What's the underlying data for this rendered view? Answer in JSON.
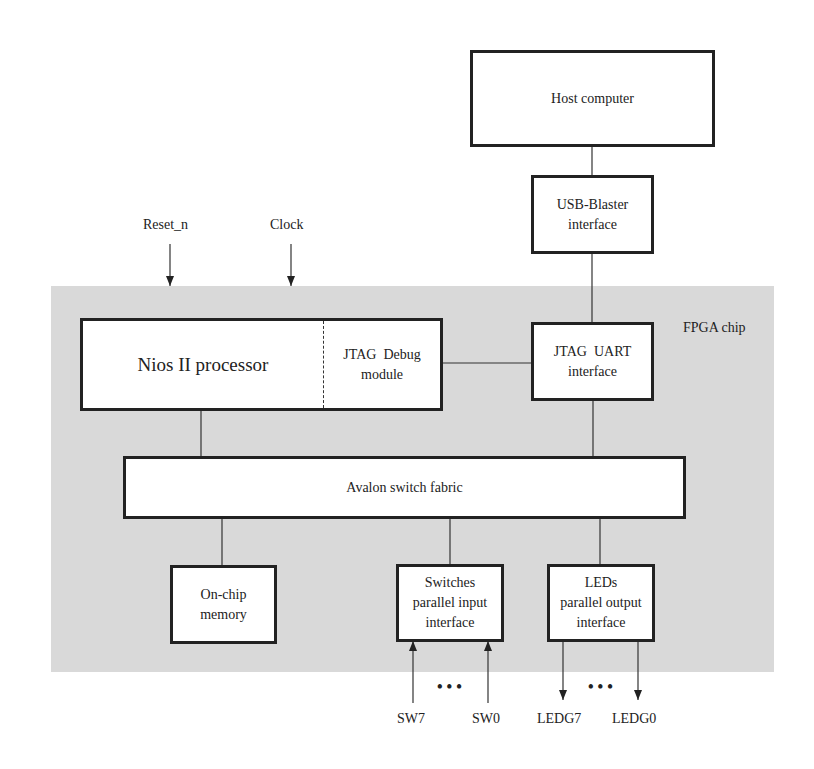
{
  "diagram": {
    "chip_label": "FPGA chip",
    "colors": {
      "chip_background": "#d9d9d9",
      "box_fill": "#ffffff",
      "stroke": "#222222"
    },
    "inputs": {
      "reset": "Reset_n",
      "clock": "Clock"
    },
    "blocks": {
      "host": {
        "line1": "Host computer"
      },
      "usb_blaster": {
        "line1": "USB-Blaster",
        "line2": "interface"
      },
      "jtag_uart": {
        "line1": "JTAG  UART",
        "line2": "interface"
      },
      "nios": {
        "main": "Nios II processor",
        "debug_line1": "JTAG  Debug",
        "debug_line2": "module"
      },
      "avalon": {
        "line1": "Avalon switch fabric"
      },
      "onchip": {
        "line1": "On-chip",
        "line2": "memory"
      },
      "switches": {
        "line1": "Switches",
        "line2": "parallel input",
        "line3": "interface"
      },
      "leds": {
        "line1": "LEDs",
        "line2": "parallel output",
        "line3": "interface"
      }
    },
    "signals": {
      "sw7": "SW7",
      "sw0": "SW0",
      "ledg7": "LEDG7",
      "ledg0": "LEDG0",
      "ellipsis": "•••"
    }
  }
}
